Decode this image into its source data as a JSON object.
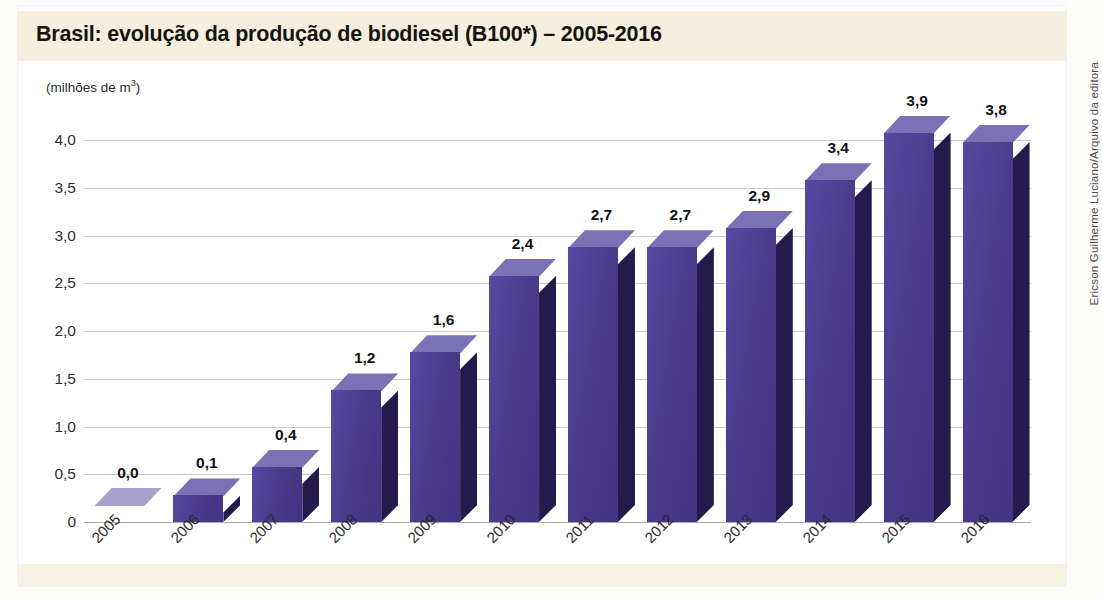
{
  "figure": {
    "title": "Brasil: evolução da produção de biodiesel (B100*) – 2005-2016",
    "credit": "Ericson Guilherme Luciano/Arquivo da editora",
    "unit_label": "(milhões de m",
    "unit_exponent": "3",
    "unit_label_close": ")"
  },
  "colors": {
    "title_band": "#f6efde",
    "bar_front": "#4a3b8c",
    "bar_top": "#7b72b6",
    "bar_side": "#241a4c",
    "gridline": "#c9c9c9",
    "text": "#141414"
  },
  "chart_data": {
    "type": "bar",
    "title": "Brasil: evolução da produção de biodiesel (B100*) – 2005-2016",
    "subtitle": "",
    "xlabel": "",
    "ylabel": "(milhões de m³)",
    "ylim": [
      0,
      4.0
    ],
    "grid": true,
    "legend": "none",
    "categories": [
      "2005",
      "2006",
      "2007",
      "2008",
      "2009",
      "2010",
      "2011",
      "2012",
      "2013",
      "2014",
      "2015",
      "2016"
    ],
    "values": [
      0.0,
      0.1,
      0.4,
      1.2,
      1.6,
      2.4,
      2.7,
      2.7,
      2.9,
      3.4,
      3.9,
      3.8
    ],
    "value_labels": [
      "0,0",
      "0,1",
      "0,4",
      "1,2",
      "1,6",
      "2,4",
      "2,7",
      "2,7",
      "2,9",
      "3,4",
      "3,9",
      "3,8"
    ],
    "ytick_values": [
      4.0,
      3.5,
      3.0,
      2.5,
      2.0,
      1.5,
      1.0,
      0.5,
      0
    ],
    "ytick_labels": [
      "4,0",
      "3,5",
      "3,0",
      "2,5",
      "2,0",
      "1,5",
      "1,0",
      "0,5",
      "0"
    ]
  }
}
